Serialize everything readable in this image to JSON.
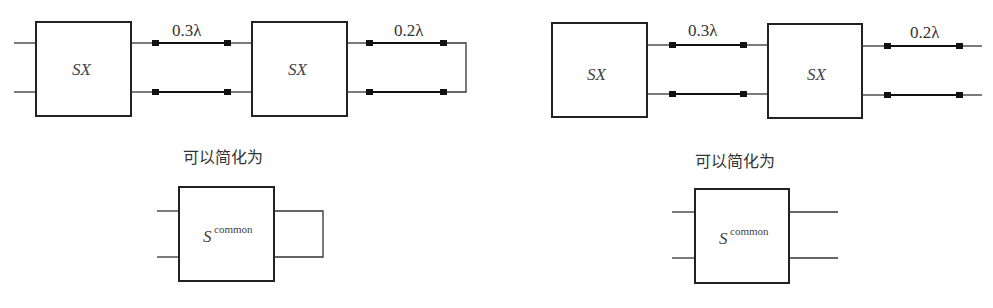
{
  "left_diagram": {
    "block1_label": "SX",
    "block2_label": "SX",
    "line1_label": "0.3λ",
    "line2_label": "0.2λ",
    "termination": "shorted loop",
    "caption": "可以简化为",
    "simplified_symbol": "S",
    "simplified_superscript": "common"
  },
  "right_diagram": {
    "block1_label": "SX",
    "block2_label": "SX",
    "line1_label": "0.3λ",
    "line2_label": "0.2λ",
    "termination": "open ports",
    "caption": "可以简化为",
    "simplified_symbol": "S",
    "simplified_superscript": "common"
  }
}
